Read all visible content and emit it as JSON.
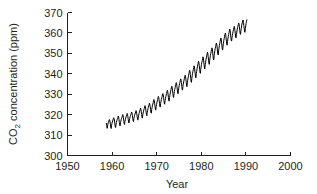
{
  "chart_data": {
    "type": "line",
    "title": "",
    "xlabel": "Year",
    "ylabel": "CO2 concentration (ppm)",
    "ylabel_prefix": "CO",
    "ylabel_subscript": "2",
    "ylabel_suffix": " concentration (ppm)",
    "xlim": [
      1950,
      2000
    ],
    "ylim": [
      300,
      370
    ],
    "xticks": [
      1950,
      1960,
      1970,
      1980,
      1990,
      2000
    ],
    "xtick_labels": [
      "1950",
      "1960",
      "1970",
      "1980",
      "1990",
      "2000"
    ],
    "yticks": [
      300,
      310,
      320,
      330,
      340,
      350,
      360,
      370
    ],
    "ytick_labels": [
      "300",
      "310",
      "320",
      "330",
      "340",
      "350",
      "360",
      "370"
    ],
    "grid": false,
    "legend": false,
    "line_color": "#000000",
    "series_name": "Mauna Loa monthly mean CO2",
    "data_start_year": 1958.7,
    "data_end_year": 1997.4,
    "seasonal_amplitude_ppm": 3.1,
    "annotation": "Monthly atmospheric CO2 with annual seasonal cycle superimposed on a rising trend",
    "x": [
      1958.71,
      1958.79,
      1958.88,
      1958.96,
      1959.04,
      1959.13,
      1959.21,
      1959.29,
      1959.38,
      1959.46,
      1959.54,
      1959.63,
      1959.71,
      1959.79,
      1959.88,
      1959.96,
      1960.04,
      1960.13,
      1960.21,
      1960.29,
      1960.38,
      1960.46,
      1960.54,
      1960.63,
      1960.71,
      1960.79,
      1960.88,
      1960.96,
      1961.04,
      1961.13,
      1961.21,
      1961.29,
      1961.38,
      1961.46,
      1961.54,
      1961.63,
      1961.71,
      1961.79,
      1961.88,
      1961.96,
      1962.04,
      1962.13,
      1962.21,
      1962.29,
      1962.38,
      1962.46,
      1962.54,
      1962.63,
      1962.71,
      1962.79,
      1962.88,
      1962.96,
      1963.04,
      1963.13,
      1963.21,
      1963.29,
      1963.38,
      1963.46,
      1963.54,
      1963.63,
      1963.71,
      1963.79,
      1963.88,
      1963.96,
      1964.04,
      1964.13,
      1964.21,
      1964.29,
      1964.38,
      1964.46,
      1964.54,
      1964.63,
      1964.71,
      1964.79,
      1964.88,
      1964.96,
      1965.04,
      1965.13,
      1965.21,
      1965.29,
      1965.38,
      1965.46,
      1965.54,
      1965.63,
      1965.71,
      1965.79,
      1965.88,
      1965.96,
      1966.04,
      1966.13,
      1966.21,
      1966.29,
      1966.38,
      1966.46,
      1966.54,
      1966.63,
      1966.71,
      1966.79,
      1966.88,
      1966.96,
      1967.04,
      1967.13,
      1967.21,
      1967.29,
      1967.38,
      1967.46,
      1967.54,
      1967.63,
      1967.71,
      1967.79,
      1967.88,
      1967.96,
      1968.04,
      1968.13,
      1968.21,
      1968.29,
      1968.38,
      1968.46,
      1968.54,
      1968.63,
      1968.71,
      1968.79,
      1968.88,
      1968.96,
      1969.04,
      1969.13,
      1969.21,
      1969.29,
      1969.38,
      1969.46,
      1969.54,
      1969.63,
      1969.71,
      1969.79,
      1969.88,
      1969.96,
      1970.04,
      1970.13,
      1970.21,
      1970.29,
      1970.38,
      1970.46,
      1970.54,
      1970.63,
      1970.71,
      1970.79,
      1970.88,
      1970.96,
      1971.04,
      1971.13,
      1971.21,
      1971.29,
      1971.38,
      1971.46,
      1971.54,
      1971.63,
      1971.71,
      1971.79,
      1971.88,
      1971.96,
      1972.04,
      1972.13,
      1972.21,
      1972.29,
      1972.38,
      1972.46,
      1972.54,
      1972.63,
      1972.71,
      1972.79,
      1972.88,
      1972.96,
      1973.04,
      1973.13,
      1973.21,
      1973.29,
      1973.38,
      1973.46,
      1973.54,
      1973.63,
      1973.71,
      1973.79,
      1973.88,
      1973.96,
      1974.04,
      1974.13,
      1974.21,
      1974.29,
      1974.38,
      1974.46,
      1974.54,
      1974.63,
      1974.71,
      1974.79,
      1974.88,
      1974.96,
      1975.04,
      1975.13,
      1975.21,
      1975.29,
      1975.38,
      1975.46,
      1975.54,
      1975.63,
      1975.71,
      1975.79,
      1975.88,
      1975.96,
      1976.04,
      1976.13,
      1976.21,
      1976.29,
      1976.38,
      1976.46,
      1976.54,
      1976.63,
      1976.71,
      1976.79,
      1976.88,
      1976.96,
      1977.04,
      1977.13,
      1977.21,
      1977.29,
      1977.38,
      1977.46,
      1977.54,
      1977.63,
      1977.71,
      1977.79,
      1977.88,
      1977.96,
      1978.04,
      1978.13,
      1978.21,
      1978.29,
      1978.38,
      1978.46,
      1978.54,
      1978.63,
      1978.71,
      1978.79,
      1978.88,
      1978.96,
      1979.04,
      1979.13,
      1979.21,
      1979.29,
      1979.38,
      1979.46,
      1979.54,
      1979.63,
      1979.71,
      1979.79,
      1979.88,
      1979.96,
      1980.04,
      1980.13,
      1980.21,
      1980.29,
      1980.38,
      1980.46,
      1980.54,
      1980.63,
      1980.71,
      1980.79,
      1980.88,
      1980.96,
      1981.04,
      1981.13,
      1981.21,
      1981.29,
      1981.38,
      1981.46,
      1981.54,
      1981.63,
      1981.71,
      1981.79,
      1981.88,
      1981.96,
      1982.04,
      1982.13,
      1982.21,
      1982.29,
      1982.38,
      1982.46,
      1982.54,
      1982.63,
      1982.71,
      1982.79,
      1982.88,
      1982.96,
      1983.04,
      1983.13,
      1983.21,
      1983.29,
      1983.38,
      1983.46,
      1983.54,
      1983.63,
      1983.71,
      1983.79,
      1983.88,
      1983.96,
      1984.04,
      1984.13,
      1984.21,
      1984.29,
      1984.38,
      1984.46,
      1984.54,
      1984.63,
      1984.71,
      1984.79,
      1984.88,
      1984.96,
      1985.04,
      1985.13,
      1985.21,
      1985.29,
      1985.38,
      1985.46,
      1985.54,
      1985.63,
      1985.71,
      1985.79,
      1985.88,
      1985.96,
      1986.04,
      1986.13,
      1986.21,
      1986.29,
      1986.38,
      1986.46,
      1986.54,
      1986.63,
      1986.71,
      1986.79,
      1986.88,
      1986.96,
      1987.04,
      1987.13,
      1987.21,
      1987.29,
      1987.38,
      1987.46,
      1987.54,
      1987.63,
      1987.71,
      1987.79,
      1987.88,
      1987.96,
      1988.04,
      1988.13,
      1988.21,
      1988.29,
      1988.38,
      1988.46,
      1988.54,
      1988.63,
      1988.71,
      1988.79,
      1988.88,
      1988.96,
      1989.04,
      1989.13,
      1989.21,
      1989.29,
      1989.38,
      1989.46,
      1989.54,
      1989.63,
      1989.71,
      1989.79,
      1989.88,
      1989.96,
      1990.04,
      1990.13,
      1990.21,
      1990.29,
      1990.38,
      1990.46,
      1990.54,
      1990.63,
      1990.71,
      1990.79,
      1990.88,
      1990.96,
      1991.04,
      1991.13,
      1991.21,
      1991.29,
      1991.38,
      1991.46,
      1991.54,
      1991.63,
      1991.71,
      1991.79,
      1991.88,
      1991.96,
      1992.04,
      1992.13,
      1992.21,
      1992.29,
      1992.38,
      1992.46,
      1992.54,
      1992.63,
      1992.71,
      1992.79,
      1992.88,
      1992.96,
      1993.04,
      1993.13,
      1993.21,
      1993.29,
      1993.38,
      1993.46,
      1993.54,
      1993.63,
      1993.71,
      1993.79,
      1993.88,
      1993.96,
      1994.04,
      1994.13,
      1994.21,
      1994.29,
      1994.38,
      1994.46,
      1994.54,
      1994.63,
      1994.71,
      1994.79,
      1994.88,
      1994.96,
      1995.04,
      1995.13,
      1995.21,
      1995.29,
      1995.38,
      1995.46,
      1995.54,
      1995.63,
      1995.71,
      1995.79,
      1995.88,
      1995.96,
      1996.04,
      1996.13,
      1996.21,
      1996.29,
      1996.38,
      1996.46,
      1996.54,
      1996.63,
      1996.71,
      1996.79,
      1996.88,
      1996.96,
      1997.04,
      1997.13,
      1997.21,
      1997.29,
      1997.38
    ],
    "y": [
      315.7,
      314.8,
      313.3,
      314.0,
      315.2,
      316.0,
      316.4,
      317.0,
      317.6,
      317.5,
      316.4,
      315.0,
      313.6,
      313.2,
      314.8,
      315.6,
      316.4,
      316.9,
      317.5,
      318.2,
      318.5,
      318.0,
      316.9,
      315.4,
      314.0,
      313.7,
      315.2,
      316.1,
      316.9,
      317.5,
      318.0,
      318.6,
      319.3,
      318.8,
      317.7,
      316.2,
      314.9,
      314.5,
      316.0,
      316.8,
      317.6,
      318.2,
      318.7,
      319.3,
      320.0,
      319.5,
      318.4,
      316.9,
      315.6,
      315.2,
      316.7,
      317.5,
      318.3,
      318.9,
      319.4,
      320.0,
      320.6,
      320.1,
      319.0,
      317.6,
      316.3,
      315.9,
      317.4,
      318.2,
      319.0,
      319.6,
      320.1,
      320.7,
      321.3,
      320.8,
      319.7,
      318.3,
      317.0,
      316.6,
      318.1,
      318.9,
      319.7,
      320.3,
      320.8,
      321.4,
      322.0,
      321.5,
      320.4,
      319.0,
      317.7,
      317.3,
      318.8,
      319.7,
      320.5,
      321.2,
      321.8,
      322.5,
      323.2,
      322.7,
      321.5,
      320.0,
      318.7,
      318.3,
      319.9,
      320.8,
      321.7,
      322.4,
      323.0,
      323.7,
      324.4,
      323.9,
      322.7,
      321.2,
      319.9,
      319.5,
      321.1,
      322.0,
      322.9,
      323.6,
      324.2,
      324.9,
      325.6,
      325.1,
      323.9,
      322.4,
      321.1,
      320.7,
      322.4,
      323.4,
      324.4,
      325.2,
      325.9,
      326.7,
      327.4,
      326.9,
      325.6,
      324.0,
      322.6,
      322.2,
      323.9,
      324.9,
      325.9,
      326.7,
      327.4,
      328.2,
      328.9,
      328.4,
      327.1,
      325.5,
      324.1,
      323.7,
      325.4,
      326.4,
      327.4,
      328.2,
      328.9,
      329.6,
      330.3,
      329.8,
      328.5,
      326.9,
      325.5,
      325.1,
      326.8,
      327.8,
      328.8,
      329.6,
      330.3,
      331.1,
      331.9,
      331.4,
      330.1,
      328.4,
      327.0,
      326.6,
      328.4,
      329.5,
      330.6,
      331.5,
      332.3,
      333.1,
      333.9,
      333.4,
      332.0,
      330.3,
      328.8,
      328.4,
      330.2,
      331.3,
      332.4,
      333.3,
      334.1,
      334.9,
      335.7,
      335.2,
      333.8,
      332.1,
      330.6,
      330.2,
      332.0,
      333.1,
      334.2,
      335.1,
      335.9,
      336.7,
      337.5,
      337.0,
      335.6,
      333.9,
      332.4,
      332.0,
      333.8,
      334.9,
      336.0,
      336.9,
      337.7,
      338.5,
      339.3,
      338.8,
      337.4,
      335.6,
      334.1,
      333.7,
      335.6,
      336.8,
      338.0,
      339.0,
      339.9,
      340.8,
      341.7,
      341.2,
      339.7,
      337.8,
      336.2,
      335.8,
      337.8,
      339.0,
      340.2,
      341.2,
      342.1,
      343.0,
      343.9,
      343.4,
      341.9,
      340.0,
      338.4,
      338.0,
      340.0,
      341.2,
      342.4,
      343.4,
      344.3,
      345.2,
      346.1,
      345.6,
      344.1,
      342.2,
      340.6,
      340.2,
      342.2,
      343.4,
      344.6,
      345.6,
      346.5,
      347.4,
      348.3,
      347.8,
      346.3,
      344.4,
      342.8,
      342.4,
      344.4,
      345.6,
      346.8,
      347.8,
      348.7,
      349.6,
      350.5,
      350.0,
      348.5,
      346.6,
      345.0,
      344.6,
      346.6,
      347.8,
      349.0,
      350.0,
      350.9,
      351.8,
      352.7,
      352.2,
      350.7,
      348.8,
      347.2,
      346.8,
      348.8,
      350.1,
      351.4,
      352.4,
      353.3,
      354.2,
      355.1,
      354.6,
      353.1,
      351.2,
      349.6,
      349.2,
      351.2,
      352.5,
      353.8,
      354.8,
      355.7,
      356.6,
      357.5,
      357.0,
      355.5,
      353.6,
      352.0,
      351.6,
      353.6,
      354.9,
      356.2,
      357.2,
      358.1,
      359.0,
      359.9,
      359.4,
      357.9,
      356.0,
      354.4,
      354.0,
      355.8,
      357.0,
      358.2,
      359.2,
      360.1,
      361.0,
      361.9,
      361.4,
      359.9,
      358.0,
      356.4,
      356.0,
      357.6,
      358.7,
      359.8,
      360.8,
      361.6,
      362.4,
      363.2,
      362.7,
      361.3,
      359.5,
      358.0,
      357.6,
      359.3,
      360.4,
      361.5,
      362.5,
      363.3,
      364.1,
      364.9,
      364.4,
      363.0,
      361.2,
      359.7,
      359.3,
      361.0,
      362.2,
      363.4,
      364.4,
      365.3,
      366.1,
      366.3,
      365.1,
      363.6,
      361.9,
      360.5,
      360.3,
      362.1,
      363.4,
      364.6,
      365.6,
      366.4
    ]
  }
}
